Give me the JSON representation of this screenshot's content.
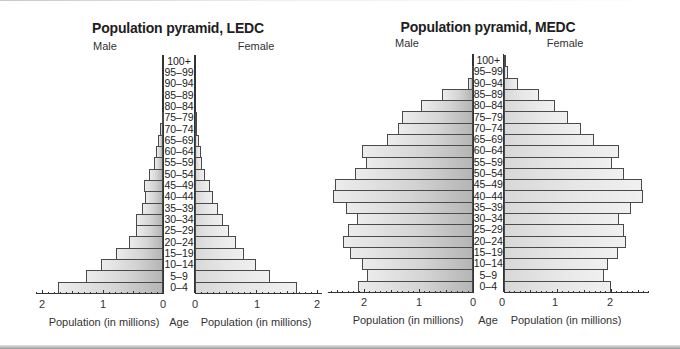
{
  "chart_data": [
    {
      "type": "bar",
      "subtype": "population-pyramid",
      "title": "Population pyramid, LEDC",
      "left_label": "Male",
      "right_label": "Female",
      "xlabel_left": "Population (in millions)",
      "xlabel_right": "Population (in millions)",
      "ylabel": "Age",
      "xlim": [
        0,
        2
      ],
      "xticks": [
        2,
        1,
        0,
        0,
        1,
        2
      ],
      "categories": [
        "100+",
        "95–99",
        "90–94",
        "85–89",
        "80–84",
        "75–79",
        "70–74",
        "65–69",
        "60–64",
        "55–59",
        "50–54",
        "45–49",
        "40–44",
        "35–39",
        "30–34",
        "25–29",
        "20–24",
        "15–19",
        "10–14",
        "5–9",
        "0–4"
      ],
      "series": [
        {
          "name": "Male",
          "values": [
            0,
            0,
            0,
            0,
            0,
            0.02,
            0.05,
            0.08,
            0.12,
            0.15,
            0.23,
            0.31,
            0.29,
            0.35,
            0.44,
            0.45,
            0.57,
            0.78,
            1.03,
            1.27,
            1.74
          ]
        },
        {
          "name": "Female",
          "values": [
            0,
            0,
            0,
            0,
            0,
            0.02,
            0.04,
            0.07,
            0.1,
            0.12,
            0.17,
            0.24,
            0.29,
            0.37,
            0.46,
            0.56,
            0.67,
            0.81,
            1.0,
            1.23,
            1.68
          ]
        }
      ],
      "grid": false
    },
    {
      "type": "bar",
      "subtype": "population-pyramid",
      "title": "Population pyramid, MEDC",
      "left_label": "Male",
      "right_label": "Female",
      "xlabel_left": "Population (in millions)",
      "xlabel_right": "Population (in millions)",
      "ylabel": "Age",
      "xlim": [
        0,
        2.7
      ],
      "xticks": [
        2,
        1,
        0,
        0,
        1,
        2
      ],
      "categories": [
        "100+",
        "95–99",
        "90–94",
        "85–89",
        "80–84",
        "75–79",
        "70–74",
        "65–69",
        "60–64",
        "55–59",
        "50–54",
        "45–49",
        "40–44",
        "35–39",
        "30–34",
        "25–29",
        "20–24",
        "15–19",
        "10–14",
        "5–9",
        "0–4"
      ],
      "series": [
        {
          "name": "Male",
          "values": [
            0,
            0.01,
            0.1,
            0.56,
            0.96,
            1.3,
            1.38,
            1.57,
            2.03,
            1.96,
            2.17,
            2.53,
            2.56,
            2.33,
            2.13,
            2.29,
            2.38,
            2.26,
            2.03,
            1.94,
            2.11
          ]
        },
        {
          "name": "Female",
          "values": [
            0.02,
            0.09,
            0.27,
            0.66,
            0.96,
            1.21,
            1.44,
            1.69,
            2.16,
            2.03,
            2.25,
            2.59,
            2.6,
            2.37,
            2.16,
            2.25,
            2.29,
            2.14,
            1.95,
            1.88,
            2.01
          ]
        }
      ],
      "grid": false
    }
  ],
  "charts": [
    {
      "title": "Population pyramid, LEDC",
      "male_label": "Male",
      "female_label": "Female",
      "age_label": "Age",
      "xlabel": "Population (in millions)",
      "tick_labels_left": [
        "2",
        "1",
        "0"
      ],
      "tick_labels_right": [
        "0",
        "1",
        "2"
      ]
    },
    {
      "title": "Population pyramid, MEDC",
      "male_label": "Male",
      "female_label": "Female",
      "age_label": "Age",
      "xlabel": "Population (in millions)",
      "tick_labels_left": [
        "2",
        "1",
        "0"
      ],
      "tick_labels_right": [
        "0",
        "1",
        "2"
      ]
    }
  ]
}
